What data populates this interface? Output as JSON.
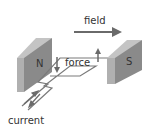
{
  "diagram": {
    "labels": {
      "field": "field",
      "force": "force",
      "current": "current",
      "north_pole": "N",
      "south_pole": "S"
    },
    "colors": {
      "magnet_front": "#8a8a8a",
      "magnet_side": "#b0b0b0",
      "magnet_top": "#c4c4c4",
      "wire": "#7a7a7a",
      "arrow": "#6a6a6a",
      "text": "#333333"
    }
  }
}
